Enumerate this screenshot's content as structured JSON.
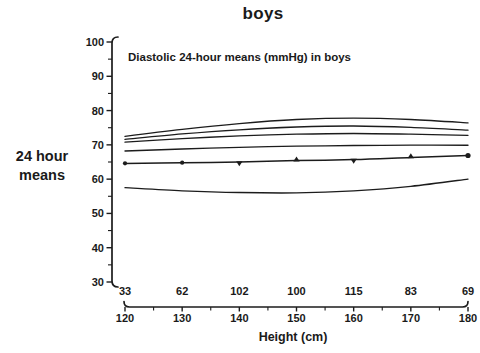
{
  "figure": {
    "title": "boys",
    "ylabel_lines": [
      "24 hour",
      "means"
    ],
    "annotation": "Diastolic 24-hour means (mmHg) in boys",
    "xlabel": "Height (cm)"
  },
  "chart_data": {
    "type": "line",
    "title": "boys",
    "annotation": "Diastolic 24-hour means (mmHg) in boys",
    "xlabel": "Height (cm)",
    "ylabel": "24 hour means",
    "x": [
      120,
      130,
      140,
      150,
      160,
      170,
      180
    ],
    "xlim": [
      120,
      180
    ],
    "ylim": [
      30,
      100
    ],
    "y_ticks_major": [
      30,
      40,
      50,
      60,
      70,
      80,
      90,
      100
    ],
    "y_tick_minor_step": 5,
    "x_tick_minor_step": 5,
    "counts_per_height_class": [
      33,
      62,
      102,
      100,
      115,
      83,
      69
    ],
    "grid": false,
    "legend": null,
    "line_color": "#1c1c1c",
    "background": "#ffffff",
    "series": [
      {
        "name": "upper-curve-1",
        "values": [
          72.5,
          74.5,
          76.2,
          77.4,
          77.8,
          77.4,
          76.4
        ]
      },
      {
        "name": "upper-curve-2",
        "values": [
          71.6,
          73.2,
          74.4,
          75.2,
          75.5,
          75.1,
          74.3
        ]
      },
      {
        "name": "upper-curve-3",
        "values": [
          70.8,
          71.8,
          72.6,
          73.1,
          73.3,
          73.1,
          72.8
        ]
      },
      {
        "name": "upper-curve-4",
        "values": [
          68.2,
          68.8,
          69.3,
          69.6,
          69.8,
          69.9,
          69.9
        ]
      },
      {
        "name": "means",
        "values": [
          64.6,
          64.8,
          65.0,
          65.4,
          65.7,
          66.3,
          66.9
        ],
        "markers": [
          "dot",
          "dot",
          "triangle-down",
          "triangle-up",
          "triangle-down",
          "triangle-up",
          "dot"
        ]
      },
      {
        "name": "lower-curve",
        "values": [
          57.5,
          56.6,
          56.1,
          56.0,
          56.6,
          57.9,
          60.0
        ]
      }
    ]
  }
}
